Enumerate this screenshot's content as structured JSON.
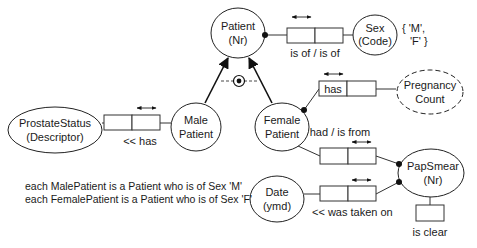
{
  "entities": {
    "patient": {
      "line1": "Patient",
      "line2": "(Nr)"
    },
    "sex": {
      "line1": "Sex",
      "line2": "(Code)"
    },
    "sex_values": {
      "line1": "{ 'M',",
      "line2": "'F' }"
    },
    "pregnancy": {
      "line1": "Pregnancy",
      "line2": "Count"
    },
    "prostate": {
      "line1": "ProstateStatus",
      "line2": "(Descriptor)"
    },
    "male": {
      "line1": "Male",
      "line2": "Patient"
    },
    "female": {
      "line1": "Female",
      "line2": "Patient"
    },
    "papsmear": {
      "line1": "PapSmear",
      "line2": "(Nr)"
    },
    "date": {
      "line1": "Date",
      "line2": "(ymd)"
    }
  },
  "facts": {
    "patient_sex": {
      "reading": "is of / is of"
    },
    "female_pregnancy": {
      "reading": "has"
    },
    "male_prostate": {
      "reading": "<< has"
    },
    "female_papsmear": {
      "reading": "had / is from"
    },
    "papsmear_date": {
      "reading": "<< was taken on"
    },
    "papsmear_clear": {
      "reading": "is clear"
    }
  },
  "notes": {
    "line1": "each MalePatient is a Patient who is of Sex 'M'",
    "line2": "each FemalePatient is a Patient who is of Sex 'F'"
  }
}
